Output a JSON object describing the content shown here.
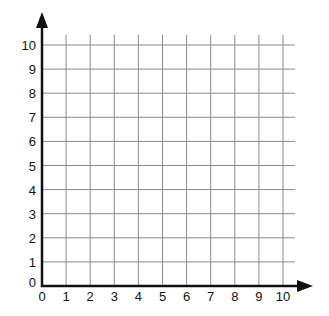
{
  "grid": {
    "x_ticks": [
      "0",
      "1",
      "2",
      "3",
      "4",
      "5",
      "6",
      "7",
      "8",
      "9",
      "10"
    ],
    "y_ticks": [
      "0",
      "1",
      "2",
      "3",
      "4",
      "5",
      "6",
      "7",
      "8",
      "9",
      "10"
    ],
    "grid_color": "#8a8a8a",
    "axis_color": "#111111"
  }
}
